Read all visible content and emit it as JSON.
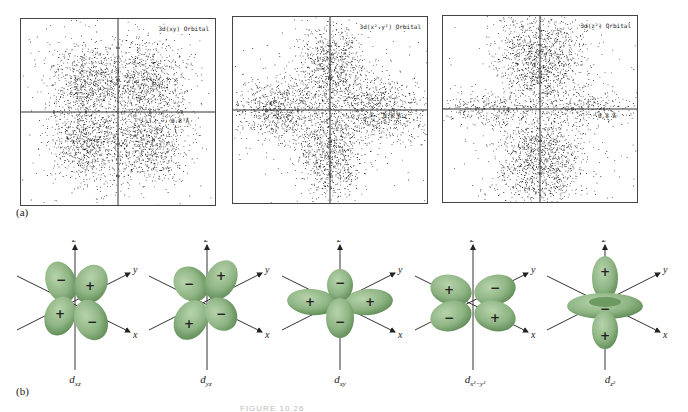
{
  "part_a": {
    "label": "(a)",
    "panels": [
      {
        "title": "3d(xy) Orbital",
        "scale": "0.8 Å",
        "type": "dxy"
      },
      {
        "title": "3d(x²-y²) Orbital",
        "scale": "0.8 Å",
        "type": "dx2y2"
      },
      {
        "title": "3d(z²) Orbital",
        "scale": "0.8 Å",
        "type": "dz2"
      }
    ]
  },
  "part_b": {
    "label": "(b)",
    "orbitals": [
      {
        "name": "d",
        "sub": "xz",
        "signs": [
          "−",
          "+",
          "+",
          "−"
        ]
      },
      {
        "name": "d",
        "sub": "yz",
        "signs": [
          "−",
          "+",
          "+",
          "−"
        ]
      },
      {
        "name": "d",
        "sub": "xy",
        "signs": [
          "−",
          "+",
          "+",
          "−"
        ]
      },
      {
        "name": "d",
        "sub": "x²−y²",
        "signs": [
          "+",
          "−",
          "−",
          "+"
        ]
      },
      {
        "name": "d",
        "sub": "z²",
        "signs": [
          "+",
          "−",
          "+"
        ]
      }
    ],
    "axes": {
      "x": "x",
      "y": "y",
      "z": "z"
    },
    "lobe_color": "#8fb584"
  },
  "caption": "FIGURE 10.26"
}
